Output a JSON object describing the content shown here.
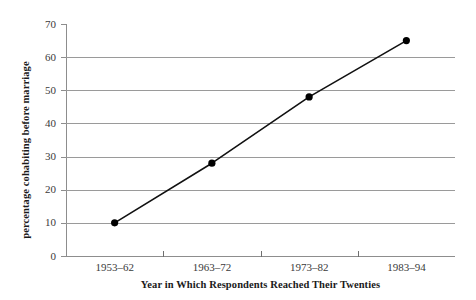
{
  "chart_data": {
    "type": "line",
    "title": "",
    "xlabel": "Year in Which Respondents Reached Their Twenties",
    "ylabel": "percentage cohabiting before marriage",
    "categories": [
      "1953–62",
      "1963–72",
      "1973–82",
      "1983–94"
    ],
    "values": [
      10,
      28,
      48,
      65
    ],
    "ylim": [
      0,
      70
    ],
    "yticks": [
      0,
      10,
      20,
      30,
      40,
      50,
      60,
      70
    ],
    "ytick_labels": [
      "0",
      "10",
      "20",
      "30",
      "40",
      "50",
      "60",
      "70"
    ],
    "grid": true,
    "legend": false,
    "marker": "filled-circle",
    "series": [
      {
        "name": "percentage cohabiting before marriage",
        "values": [
          10,
          28,
          48,
          65
        ]
      }
    ],
    "colors": {
      "line": "#111111",
      "marker": "#000000",
      "gridline": "#9a9a9a",
      "axis": "#8d8d8d",
      "tick_label": "#3a3a3a",
      "title": "#1a1a1a",
      "background": "#ffffff"
    }
  }
}
